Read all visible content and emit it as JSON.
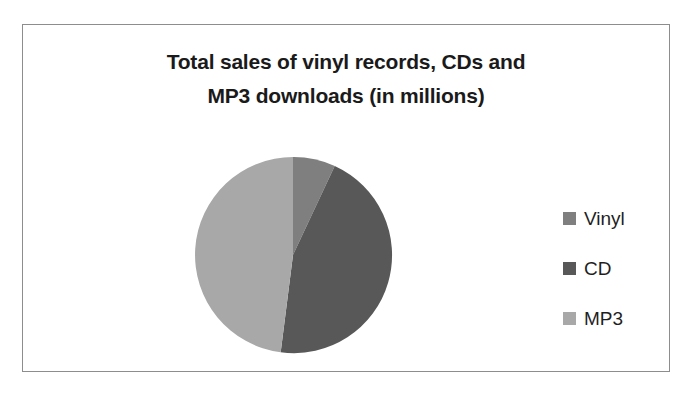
{
  "chart_data": {
    "type": "pie",
    "title": "Total sales of vinyl records, CDs and MP3 downloads (in millions)",
    "title_lines": [
      "Total sales of vinyl records, CDs and",
      "MP3 downloads (in millions)"
    ],
    "categories": [
      "Vinyl",
      "CD",
      "MP3"
    ],
    "values": [
      7,
      45,
      48
    ],
    "units": "millions",
    "legend_position": "right",
    "grid": false,
    "xlabel": "",
    "ylabel": "",
    "slices": [
      {
        "label": "Vinyl",
        "value": 7,
        "percent": 7,
        "color": "#7f7f7f",
        "start_angle_deg": 0,
        "end_angle_deg": 25.2,
        "path": "M 102 100 L 102 2 A 98 98 0 0 1 143.74 10.98 Z"
      },
      {
        "label": "CD",
        "value": 45,
        "percent": 45,
        "color": "#585858",
        "start_angle_deg": 25.2,
        "end_angle_deg": 187.2,
        "path": "M 102 100 L 143.74 10.98 A 98 98 0 0 1 89.69 197.22 Z"
      },
      {
        "label": "MP3",
        "value": 48,
        "percent": 48,
        "color": "#a8a8a8",
        "start_angle_deg": 187.2,
        "end_angle_deg": 360,
        "path": "M 102 100 L 89.69 197.22 A 98 98 0 0 1 102 2 Z"
      }
    ]
  },
  "legend": {
    "items": [
      {
        "label": "Vinyl",
        "color": "#7f7f7f"
      },
      {
        "label": "CD",
        "color": "#585858"
      },
      {
        "label": "MP3",
        "color": "#a8a8a8"
      }
    ]
  },
  "colors": {
    "frame_border": "#8d8d8d",
    "background": "#ffffff",
    "title_text": "#1a1a1a",
    "legend_text": "#1f1f1f"
  }
}
